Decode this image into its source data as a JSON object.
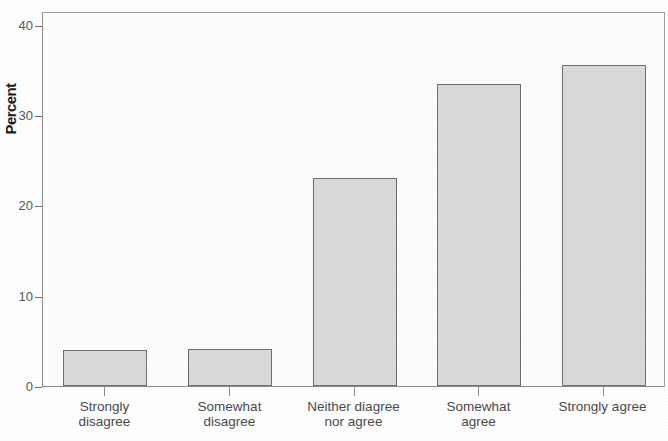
{
  "chart_data": {
    "type": "bar",
    "title": "",
    "subtitle": "",
    "xlabel": "",
    "ylabel": "Percent",
    "categories": [
      "Strongly\ndisagree",
      "Somewhat\ndisagree",
      "Neither diagree\nnor agree",
      "Somewhat\nagree",
      "Strongly agree"
    ],
    "values": [
      4.0,
      4.1,
      23.0,
      33.4,
      35.5
    ],
    "ylim": [
      0,
      41.5
    ],
    "yticks": [
      0,
      10,
      20,
      30,
      40
    ],
    "ytick_labels": [
      "0",
      "10",
      "20",
      "30",
      "40"
    ],
    "grid": false,
    "legend": false,
    "legend_position": "none",
    "bar_fill_color": "#dadada",
    "bar_border_color": "#6f6f71",
    "axis_color": "#8d8d8f",
    "text_color": "#4a4a4c"
  }
}
